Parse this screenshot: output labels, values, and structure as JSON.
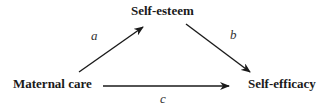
{
  "nodes": {
    "mediator": "Self-esteem",
    "predictor": "Maternal care",
    "outcome": "Self-efficacy"
  },
  "paths": {
    "a": "a",
    "b": "b",
    "c": "c"
  },
  "colors": {
    "stroke": "#1a1a1a"
  }
}
